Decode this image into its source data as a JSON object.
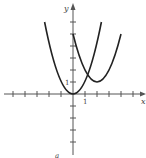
{
  "figure": {
    "x_axis_label": "x",
    "y_axis_label": "y",
    "x_tick_label": "1",
    "y_tick_label": "1",
    "bottom_caption": "a",
    "curves": [
      {
        "name": "y = x^2",
        "vertex": [
          0,
          0
        ]
      },
      {
        "name": "y = (x-2)^2 + 1",
        "vertex": [
          2,
          1
        ]
      }
    ],
    "x_range": [
      -6,
      5
    ],
    "y_range": [
      -5,
      6
    ],
    "line_color": "#222222",
    "axis_color": "#555555"
  }
}
